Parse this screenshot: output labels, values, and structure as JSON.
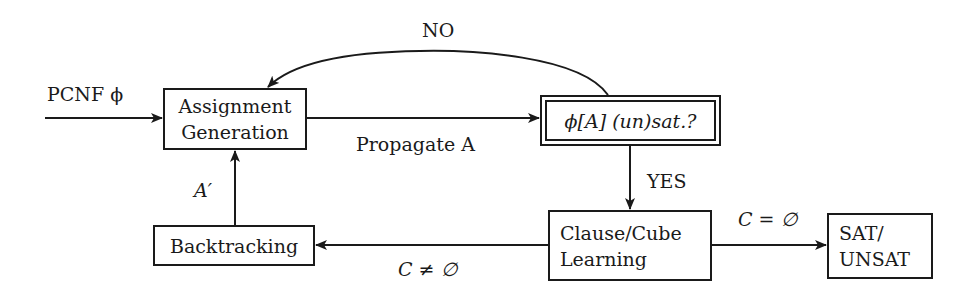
{
  "diagram": {
    "type": "flowchart",
    "nodes": {
      "assignment_generation": {
        "line1": "Assignment",
        "line2": "Generation"
      },
      "check": {
        "label": "ϕ[A]  (un)sat.?"
      },
      "backtracking": {
        "label": "Backtracking"
      },
      "learning": {
        "line1": "Clause/Cube",
        "line2": "Learning"
      },
      "result": {
        "line1": "SAT/",
        "line2": "UNSAT"
      }
    },
    "edges": {
      "input": {
        "label": "PCNF ϕ",
        "from": "input",
        "to": "assignment_generation"
      },
      "propagate": {
        "label": "Propagate A",
        "from": "assignment_generation",
        "to": "check"
      },
      "no": {
        "label": "NO",
        "from": "check",
        "to": "assignment_generation"
      },
      "yes": {
        "label": "YES",
        "from": "check",
        "to": "learning"
      },
      "c_empty": {
        "label": "C = ∅",
        "from": "learning",
        "to": "result"
      },
      "c_not_empty": {
        "label": "C ≠ ∅",
        "from": "learning",
        "to": "backtracking"
      },
      "a_prime": {
        "label": "A′",
        "from": "backtracking",
        "to": "assignment_generation"
      }
    },
    "colors": {
      "stroke": "#1a1a1a",
      "background": "#ffffff"
    }
  }
}
